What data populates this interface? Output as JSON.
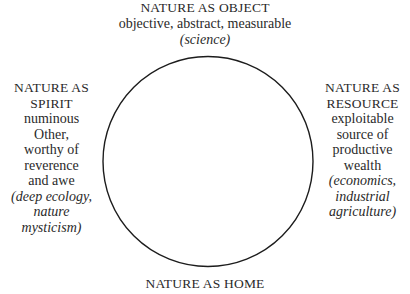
{
  "diagram": {
    "background_color": "#ffffff",
    "ink_color": "#2a2a2a",
    "circle": {
      "stroke_color": "#1c1c1c",
      "center_x": 208,
      "center_y": 161,
      "radius": 105,
      "stroke_width": 1.4
    },
    "quadrants": {
      "top": {
        "heading": "NATURE AS OBJECT",
        "lines": [
          "objective, abstract, measurable"
        ],
        "examples": [
          "(science)"
        ]
      },
      "bottom": {
        "heading": "NATURE AS HOME",
        "lines": [],
        "examples": []
      },
      "left": {
        "heading_lines": [
          "NATURE AS",
          "SPIRIT"
        ],
        "lines": [
          "numinous",
          "Other,",
          "worthy of",
          "reverence",
          "and awe"
        ],
        "examples": [
          "(deep ecology,",
          "nature",
          "mysticism)"
        ]
      },
      "right": {
        "heading_lines": [
          "NATURE AS",
          "RESOURCE"
        ],
        "lines": [
          "exploitable",
          "source of",
          "productive",
          "wealth"
        ],
        "examples": [
          "(economics,",
          "industrial",
          "agriculture)"
        ]
      }
    }
  }
}
